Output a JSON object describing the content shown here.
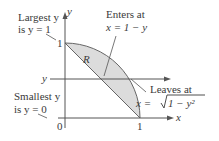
{
  "figure": {
    "axes": {
      "x_label": "x",
      "y_label": "y",
      "origin_label": "0",
      "x_tick_label": "1",
      "y_tick_label": "1"
    },
    "region_label": "R",
    "slice_label": "y",
    "annotations": {
      "largest_line1": "Largest y",
      "largest_line2": "is y = 1",
      "smallest_line1": "Smallest y",
      "smallest_line2": "is y = 0",
      "enters_line1": "Enters at",
      "enters_line2": "x = 1 − y",
      "leaves_line1": "Leaves at",
      "leaves_line2_prefix": "x = ",
      "leaves_radicand": "1 − y²"
    },
    "colors": {
      "region_fill": "#dcdcdc",
      "stroke": "#555555"
    }
  }
}
